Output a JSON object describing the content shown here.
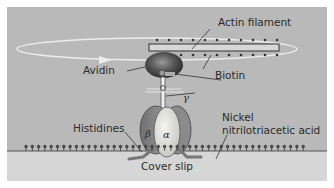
{
  "diagram": {
    "labels": {
      "actin_filament": "Actin filament",
      "avidin": "Avidin",
      "biotin": "Biotin",
      "gamma": "γ",
      "alpha": "α",
      "beta": "β",
      "histidines": "Histidines",
      "nickel_line1": "Nickel",
      "nickel_line2": "nitrilotriacetic acid",
      "cover_slip": "Cover slip"
    },
    "colors": {
      "background_panel": "#b9b9b9",
      "cover_slip": "#d6d6d6",
      "frame": "#ffffff",
      "alpha_subunit": "#e6e6e2",
      "beta_subunit": "#8a8a8a",
      "avidin": "#4a4a4a",
      "text": "#2a2a2a",
      "rotation_arrow": "#ececec"
    },
    "components": [
      {
        "name": "Actin filament",
        "role": "rotating rod with biotin attachments"
      },
      {
        "name": "Avidin",
        "role": "links biotinylated actin to gamma subunit"
      },
      {
        "name": "Biotin",
        "role": "attachment points on actin filament"
      },
      {
        "name": "γ subunit",
        "role": "rotor shaft"
      },
      {
        "name": "α subunit",
        "role": "stator"
      },
      {
        "name": "β subunit",
        "role": "stator"
      },
      {
        "name": "Histidines",
        "role": "His-tags anchoring beta to surface"
      },
      {
        "name": "Nickel nitrilotriacetic acid",
        "role": "surface chelator binding His-tags"
      },
      {
        "name": "Cover slip",
        "role": "glass substrate"
      }
    ]
  }
}
